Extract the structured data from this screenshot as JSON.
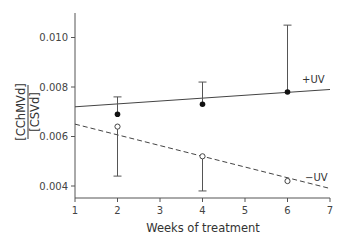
{
  "chart_data": {
    "type": "line",
    "title": "",
    "xlabel": "Weeks of treatment",
    "ylabel_numerator": "[CChMVd]",
    "ylabel_denominator": "[CSVd]",
    "xlim": [
      1,
      7
    ],
    "ylim": [
      0.0035,
      0.011
    ],
    "x_ticks": [
      1,
      2,
      3,
      4,
      5,
      6,
      7
    ],
    "y_ticks": [
      0.004,
      0.006,
      0.008,
      0.01
    ],
    "y_tick_labels": [
      "0.004",
      "0.006",
      "0.008",
      "0.010"
    ],
    "grid": false,
    "legend": "inline labels",
    "series": [
      {
        "name": "+UV",
        "marker": "filled-circle",
        "line": "solid",
        "x": [
          2,
          4,
          6
        ],
        "y": [
          0.0069,
          0.0073,
          0.0078
        ],
        "error_upper": [
          0.0076,
          0.0082,
          0.0105
        ],
        "fit_line": {
          "x": [
            1,
            7
          ],
          "y": [
            0.0072,
            0.0079
          ]
        }
      },
      {
        "name": "−UV",
        "marker": "open-circle",
        "line": "dashed",
        "x": [
          2,
          4,
          6
        ],
        "y": [
          0.0064,
          0.0052,
          0.0042
        ],
        "error_lower": [
          0.0044,
          0.0038,
          0.0042
        ],
        "fit_line": {
          "x": [
            1,
            7
          ],
          "y": [
            0.0065,
            0.0039
          ]
        }
      }
    ]
  },
  "labels": {
    "x_axis_title": "Weeks of treatment",
    "y_num": "[CChMVd]",
    "y_den": "[CSVd]",
    "plus_uv": "+UV",
    "minus_uv": "−UV"
  }
}
